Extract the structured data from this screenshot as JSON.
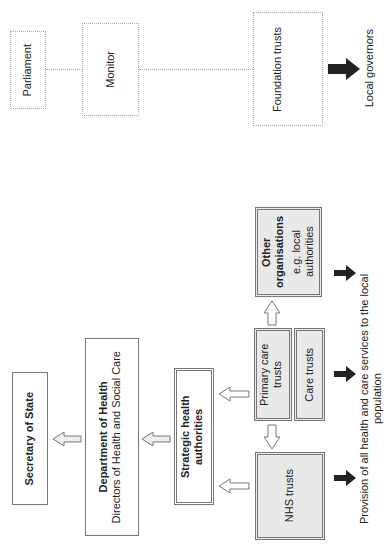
{
  "orientation": "rotated 90deg counter-clockwise",
  "top_section": {
    "parliament": "Parliament",
    "monitor": "Monitor",
    "foundation_trusts": "Foundation trusts",
    "local_governors": "Local governors"
  },
  "main_section": {
    "secretary_of_state": "Secretary of State",
    "department_of_health": {
      "title": "Department of Health",
      "subtitle": "Directors of Health and Social Care"
    },
    "strategic_health_authorities": "Strategic health authorities",
    "nhs_trusts": "NHS trusts",
    "primary_care_trusts": "Primary care trusts",
    "care_trusts": "Care trusts",
    "other_organisations": {
      "title": "Other organisations",
      "subtitle": "e.g. local authorities"
    },
    "provision_label": "Provision of all health and care services to the local population"
  },
  "colors": {
    "border": "#777777",
    "dotted_border": "#aaaaaa",
    "grey_fill": "#e9e9e9",
    "solid_arrow": "#222222"
  }
}
